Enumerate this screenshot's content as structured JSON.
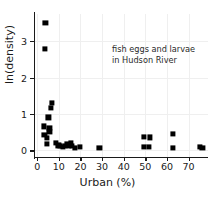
{
  "chart_data": {
    "type": "scatter",
    "title": "",
    "xlabel": "Urban (%)",
    "ylabel": "ln(density)",
    "xlim": [
      -1.5,
      79
    ],
    "ylim": [
      -0.18,
      3.75
    ],
    "xticks": [
      0,
      10,
      20,
      30,
      40,
      50,
      60,
      70
    ],
    "yticks": [
      0,
      1,
      2,
      3
    ],
    "grid": true,
    "legend": null,
    "marker": "square",
    "marker_color": "#000000",
    "annotations": [
      {
        "lines": [
          "fish eggs and larvae",
          "in Hudson River"
        ],
        "x": 42,
        "y": 2.85
      }
    ],
    "points": [
      {
        "x": 3.8,
        "y": 3.5
      },
      {
        "x": 3.5,
        "y": 2.78
      },
      {
        "x": 6.8,
        "y": 1.3
      },
      {
        "x": 6.2,
        "y": 1.17
      },
      {
        "x": 5.2,
        "y": 0.91
      },
      {
        "x": 3.1,
        "y": 0.66
      },
      {
        "x": 5.6,
        "y": 0.62
      },
      {
        "x": 5.6,
        "y": 0.5
      },
      {
        "x": 3.3,
        "y": 0.43
      },
      {
        "x": 4.6,
        "y": 0.34
      },
      {
        "x": 4.4,
        "y": 0.17
      },
      {
        "x": 8.6,
        "y": 0.2
      },
      {
        "x": 9.8,
        "y": 0.14
      },
      {
        "x": 10.6,
        "y": 0.12
      },
      {
        "x": 11.8,
        "y": 0.1
      },
      {
        "x": 12.8,
        "y": 0.12
      },
      {
        "x": 13.6,
        "y": 0.17
      },
      {
        "x": 14.6,
        "y": 0.13
      },
      {
        "x": 15.4,
        "y": 0.21
      },
      {
        "x": 16.2,
        "y": 0.12
      },
      {
        "x": 17.4,
        "y": 0.08
      },
      {
        "x": 19.8,
        "y": 0.1
      },
      {
        "x": 28.8,
        "y": 0.07
      },
      {
        "x": 49.2,
        "y": 0.37
      },
      {
        "x": 52.3,
        "y": 0.36
      },
      {
        "x": 49.4,
        "y": 0.09
      },
      {
        "x": 51.6,
        "y": 0.09
      },
      {
        "x": 62.8,
        "y": 0.46
      },
      {
        "x": 62.6,
        "y": 0.07
      },
      {
        "x": 75.2,
        "y": 0.09
      },
      {
        "x": 76.4,
        "y": 0.07
      }
    ]
  }
}
